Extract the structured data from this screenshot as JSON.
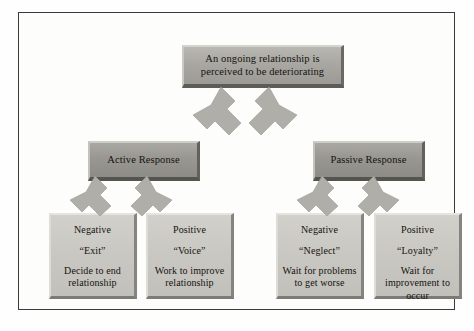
{
  "diagram": {
    "type": "flowchart",
    "title_box": {
      "id": "premise",
      "text": "An ongoing relationship is perceived to be deteriorating"
    },
    "response_boxes": [
      {
        "id": "active",
        "label": "Active Response"
      },
      {
        "id": "passive",
        "label": "Passive Response"
      }
    ],
    "outcome_boxes": [
      {
        "id": "exit",
        "valence": "Negative",
        "term": "“Exit”",
        "description": "Decide to end relationship",
        "parent": "active"
      },
      {
        "id": "voice",
        "valence": "Positive",
        "term": "“Voice”",
        "description": "Work to improve relationship",
        "parent": "active"
      },
      {
        "id": "neglect",
        "valence": "Negative",
        "term": "“Neglect”",
        "description": "Wait for problems to get worse",
        "parent": "passive"
      },
      {
        "id": "loyalty",
        "valence": "Positive",
        "term": "“Loyalty”",
        "description": "Wait for improvement to occur",
        "parent": "passive"
      }
    ],
    "colors": {
      "page_background": "#fefefe",
      "frame_border": "#3a3a38",
      "top_box_fill": "#a9a7a2",
      "mid_box_fill": "#9a9893",
      "leaf_box_fill": "#c9c7c2",
      "arrow_fill": "#b0aea9",
      "text": "#14120f"
    }
  }
}
